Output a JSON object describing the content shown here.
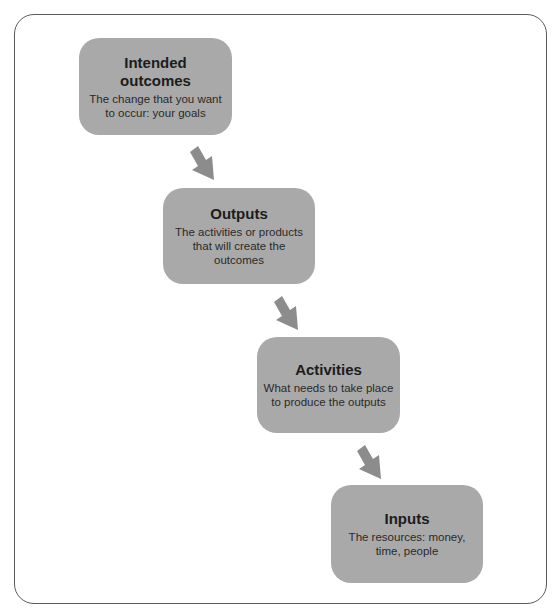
{
  "diagram": {
    "type": "logic-model-flow",
    "steps": [
      {
        "title": "Intended outcomes",
        "title_lines": [
          "Intended",
          "outcomes"
        ],
        "description": "The change that you want to occur: your goals"
      },
      {
        "title": "Outputs",
        "description": "The activities or products that will create the outcomes"
      },
      {
        "title": "Activities",
        "description": "What needs to take place to produce the outputs"
      },
      {
        "title": "Inputs",
        "description": "The resources: money, time, people"
      }
    ],
    "colors": {
      "box_fill": "#a9a9a9",
      "arrow_fill": "#8c8c8c",
      "frame_border": "#5a5a5a",
      "text": "#1c1c1c"
    }
  }
}
